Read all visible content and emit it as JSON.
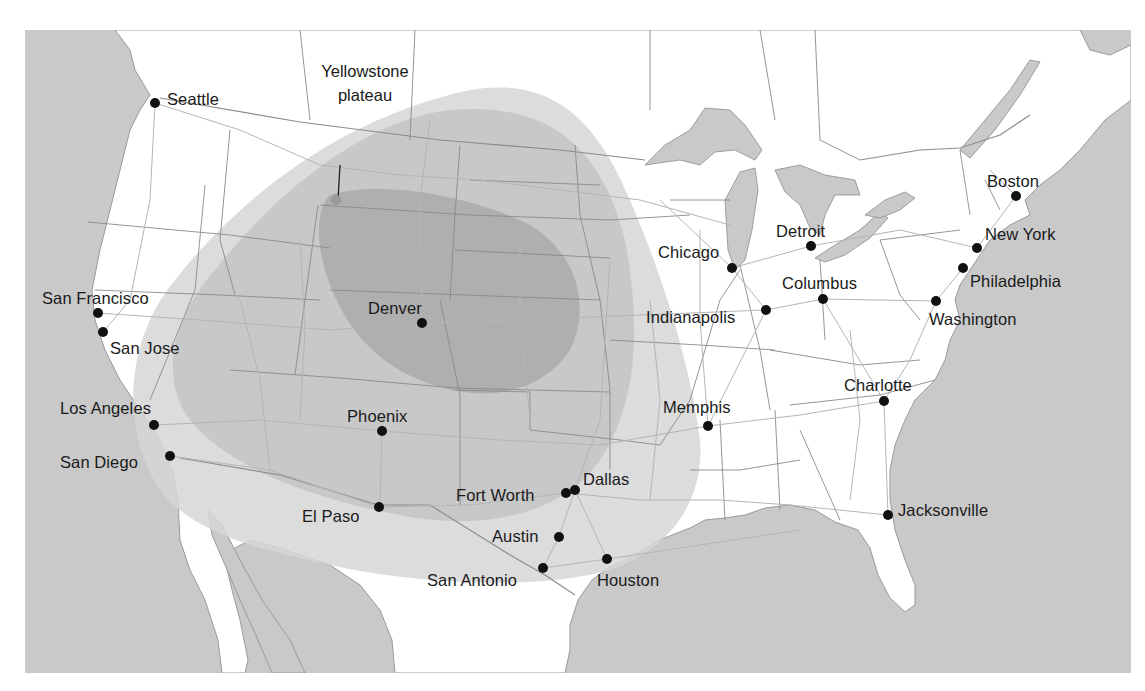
{
  "map": {
    "colors": {
      "ocean": "#c9c9c9",
      "land": "#ffffff",
      "border": "#9a9a9a",
      "road": "#b8b8b8",
      "zone_outer": "#e3e3e3",
      "zone_middle": "#cfcfcf",
      "zone_inner": "#b3b3b3",
      "dot": "#111111"
    },
    "region_label": {
      "line1": "Yellowstone",
      "line2": "plateau"
    },
    "cities": [
      {
        "name": "Seattle",
        "x": 155,
        "y": 103
      },
      {
        "name": "San Francisco",
        "x": 98,
        "y": 313
      },
      {
        "name": "San Jose",
        "x": 103,
        "y": 332
      },
      {
        "name": "Los Angeles",
        "x": 154,
        "y": 425
      },
      {
        "name": "San Diego",
        "x": 170,
        "y": 456
      },
      {
        "name": "Denver",
        "x": 422,
        "y": 323
      },
      {
        "name": "Phoenix",
        "x": 382,
        "y": 431
      },
      {
        "name": "El Paso",
        "x": 379,
        "y": 507
      },
      {
        "name": "Fort Worth",
        "x": 566,
        "y": 493
      },
      {
        "name": "Dallas",
        "x": 575,
        "y": 490
      },
      {
        "name": "Austin",
        "x": 559,
        "y": 537
      },
      {
        "name": "San Antonio",
        "x": 543,
        "y": 568
      },
      {
        "name": "Houston",
        "x": 607,
        "y": 559
      },
      {
        "name": "Chicago",
        "x": 732,
        "y": 268
      },
      {
        "name": "Detroit",
        "x": 811,
        "y": 246
      },
      {
        "name": "Indianapolis",
        "x": 766,
        "y": 310
      },
      {
        "name": "Columbus",
        "x": 823,
        "y": 299
      },
      {
        "name": "Memphis",
        "x": 708,
        "y": 426
      },
      {
        "name": "Charlotte",
        "x": 884,
        "y": 401
      },
      {
        "name": "Jacksonville",
        "x": 888,
        "y": 515
      },
      {
        "name": "Boston",
        "x": 1016,
        "y": 196
      },
      {
        "name": "New York",
        "x": 977,
        "y": 248
      },
      {
        "name": "Philadelphia",
        "x": 963,
        "y": 268
      },
      {
        "name": "Washington",
        "x": 936,
        "y": 301
      }
    ]
  }
}
